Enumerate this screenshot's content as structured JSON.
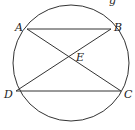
{
  "diagram": {
    "type": "circle-inscribed-quadrilateral",
    "circle": {
      "cx": 71,
      "cy": 63,
      "r": 58
    },
    "points": {
      "A": {
        "label": "A",
        "x": 27,
        "y": 29,
        "label_x": 15,
        "label_y": 31
      },
      "B": {
        "label": "B",
        "x": 111,
        "y": 29,
        "label_x": 114,
        "label_y": 31
      },
      "C": {
        "label": "C",
        "x": 121,
        "y": 91,
        "label_x": 124,
        "label_y": 98
      },
      "D": {
        "label": "D",
        "x": 16,
        "y": 91,
        "label_x": 4,
        "label_y": 98
      },
      "E": {
        "label": "E",
        "x": 68,
        "y": 58,
        "label_x": 76,
        "label_y": 61
      }
    },
    "segments": [
      {
        "name": "AB",
        "from": "A",
        "to": "B"
      },
      {
        "name": "DC",
        "from": "D",
        "to": "C"
      },
      {
        "name": "AC",
        "from": "A",
        "to": "C"
      },
      {
        "name": "BD",
        "from": "B",
        "to": "D"
      }
    ],
    "partial_text_top": "g"
  }
}
